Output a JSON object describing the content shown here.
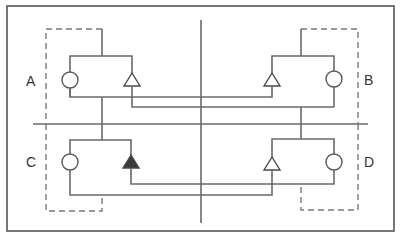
{
  "diagram": {
    "type": "quadrant-circuit",
    "border": {
      "x": 7,
      "y": 6,
      "w": 387,
      "h": 225
    },
    "dividers": {
      "vertical": {
        "x": 201,
        "y1": 20,
        "y2": 223
      },
      "horizontal": {
        "y": 124,
        "x1": 33,
        "x2": 368
      }
    },
    "units": [
      {
        "id": "A",
        "label": "A",
        "triangle": "outline",
        "position": "top-left"
      },
      {
        "id": "B",
        "label": "B",
        "triangle": "outline",
        "position": "top-right"
      },
      {
        "id": "C",
        "label": "C",
        "triangle": "filled",
        "position": "bottom-left"
      },
      {
        "id": "D",
        "label": "D",
        "triangle": "outline",
        "position": "bottom-right"
      }
    ],
    "connections": [
      {
        "from": "A.triangle",
        "to": "B.rect-bottom"
      },
      {
        "from": "B.triangle",
        "to": "A.rect-bottom"
      },
      {
        "from": "C.triangle",
        "to": "D.rect-bottom"
      },
      {
        "from": "D.triangle",
        "to": "C.rect-bottom"
      }
    ],
    "colors": {
      "line": "#6a6a6a",
      "filled_triangle": "#3a3a3a",
      "background": "#ffffff"
    }
  }
}
